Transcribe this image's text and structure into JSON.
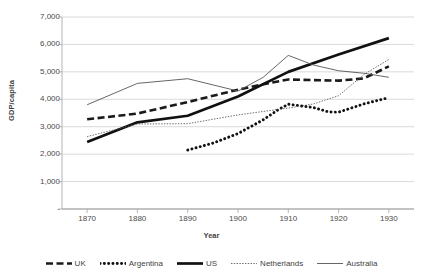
{
  "chart_data": {
    "type": "line",
    "title": "",
    "xlabel": "Year",
    "ylabel": "GDP/capita",
    "x": [
      1870,
      1875,
      1880,
      1885,
      1890,
      1895,
      1900,
      1905,
      1910,
      1915,
      1920,
      1925,
      1930
    ],
    "xlim": [
      1865,
      1935
    ],
    "ylim": [
      0,
      7000
    ],
    "yticks": [
      0,
      1000,
      2000,
      3000,
      4000,
      5000,
      6000,
      7000
    ],
    "ytick_labels": [
      "-",
      "1,000",
      "2,000",
      "3,000",
      "4,000",
      "5,000",
      "6,000",
      "7,000"
    ],
    "xticks": [
      1870,
      1880,
      1890,
      1900,
      1910,
      1920,
      1930
    ],
    "xtick_labels": [
      "1870",
      "1880",
      "1890",
      "1900",
      "1910",
      "1920",
      "1930"
    ],
    "grid": "horizontal",
    "legend_position": "bottom",
    "series": [
      {
        "name": "UK",
        "style": "thick-dashed",
        "color": "#1a1a1a",
        "x": [
          1870,
          1880,
          1890,
          1900,
          1905,
          1910,
          1915,
          1920,
          1925,
          1930
        ],
        "values": [
          3270,
          3480,
          3900,
          4350,
          4550,
          4720,
          4700,
          4680,
          4760,
          5200
        ]
      },
      {
        "name": "Argentina",
        "style": "thick-dotted",
        "color": "#111111",
        "x": [
          1890,
          1895,
          1900,
          1905,
          1908,
          1910,
          1915,
          1918,
          1920,
          1925,
          1930
        ],
        "values": [
          2150,
          2400,
          2750,
          3250,
          3620,
          3820,
          3700,
          3540,
          3530,
          3830,
          4060
        ]
      },
      {
        "name": "US",
        "style": "thick-solid",
        "color": "#111111",
        "x": [
          1870,
          1880,
          1890,
          1900,
          1910,
          1920,
          1930
        ],
        "values": [
          2440,
          3160,
          3400,
          4100,
          5000,
          5630,
          6230
        ]
      },
      {
        "name": "Netherlands",
        "style": "thin-dotted",
        "color": "#5a5a5a",
        "x": [
          1870,
          1880,
          1890,
          1900,
          1910,
          1915,
          1920,
          1925,
          1930
        ],
        "values": [
          2640,
          3100,
          3110,
          3430,
          3680,
          3830,
          4130,
          4900,
          5450
        ]
      },
      {
        "name": "Australia",
        "style": "thin-solid",
        "color": "#555555",
        "x": [
          1870,
          1880,
          1890,
          1900,
          1905,
          1910,
          1915,
          1920,
          1925,
          1930
        ],
        "values": [
          3800,
          4580,
          4750,
          4300,
          4800,
          5600,
          5250,
          5040,
          4950,
          4800
        ]
      }
    ]
  },
  "legend": {
    "items": [
      {
        "label": "UK"
      },
      {
        "label": "Argentina"
      },
      {
        "label": "US"
      },
      {
        "label": "Netherlands"
      },
      {
        "label": "Australia"
      }
    ]
  }
}
